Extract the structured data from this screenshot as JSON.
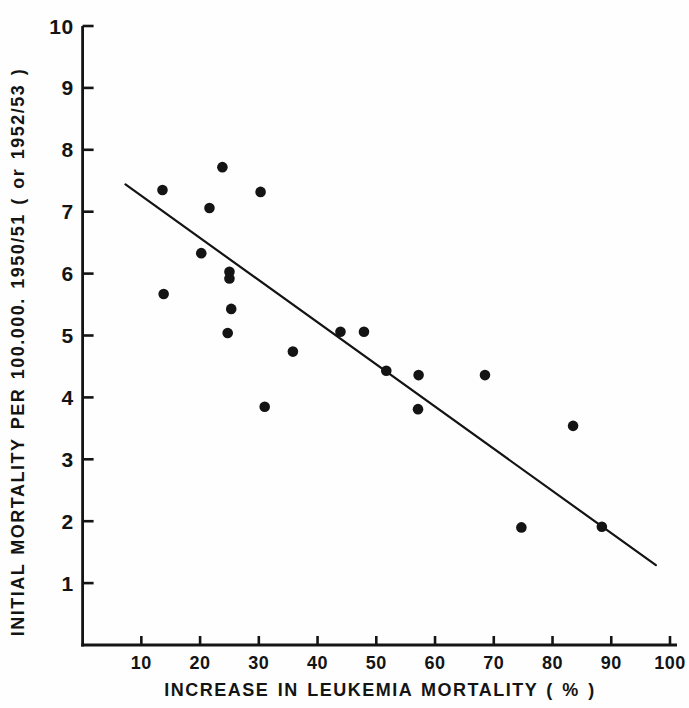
{
  "figure": {
    "background": "#fefefe",
    "ink_color": "#141414"
  },
  "chart_data": {
    "type": "scatter",
    "title": "",
    "xlabel": "INCREASE IN LEUKEMIA MORTALITY ( % )",
    "ylabel": "INITIAL MORTALITY PER 100.000. 1950/51 ( or 1952/53 )",
    "xlim": [
      0,
      101
    ],
    "ylim": [
      0,
      10
    ],
    "x_ticks": [
      10,
      20,
      30,
      40,
      50,
      60,
      70,
      80,
      90,
      100
    ],
    "y_ticks": [
      1,
      2,
      3,
      4,
      5,
      6,
      7,
      8,
      9,
      10
    ],
    "grid": false,
    "legend": null,
    "marker": "filled-circle",
    "points": [
      [
        13.6,
        7.35
      ],
      [
        23.8,
        7.72
      ],
      [
        30.3,
        7.32
      ],
      [
        21.6,
        7.06
      ],
      [
        20.2,
        6.33
      ],
      [
        25.0,
        6.03
      ],
      [
        25.0,
        5.92
      ],
      [
        13.8,
        5.67
      ],
      [
        25.3,
        5.43
      ],
      [
        24.7,
        5.04
      ],
      [
        35.8,
        4.74
      ],
      [
        31.0,
        3.85
      ],
      [
        43.9,
        5.06
      ],
      [
        47.9,
        5.06
      ],
      [
        51.7,
        4.43
      ],
      [
        57.2,
        4.36
      ],
      [
        68.5,
        4.36
      ],
      [
        57.1,
        3.81
      ],
      [
        83.5,
        3.54
      ],
      [
        74.7,
        1.9
      ],
      [
        88.4,
        1.91
      ]
    ],
    "trend_line": {
      "x1": 7.3,
      "y1": 7.44,
      "x2": 97.6,
      "y2": 1.29
    }
  }
}
